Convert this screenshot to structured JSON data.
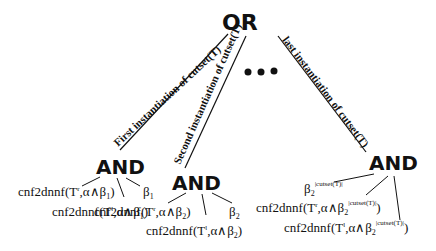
{
  "root": {
    "label": "OR"
  },
  "ellipsis": "• • •",
  "branches": [
    {
      "edge_label": "First instantiation of cutset(T)",
      "node": "AND",
      "children": [
        "cnf2dnnf(T^r,α∧β_1)",
        "β_1",
        "cnf2dnnf(T^l,α∧β_1)"
      ]
    },
    {
      "edge_label": "Second instantiation of cutset(T)",
      "node": "AND",
      "children": [
        "cnf2dnnf(T^r,α∧β_2)",
        "β_2",
        "cnf2dnnf(T^l,α∧β_2)"
      ]
    },
    {
      "edge_label": "last instantiation of cutset(T)",
      "node": "AND",
      "children": [
        "β_2^|cutset(T)|",
        "cnf2dnnf(T^r,α∧β_2^|cutset(T)|)",
        "cnf2dnnf(T^l,α∧β_2^|cutset(T)|)"
      ]
    }
  ],
  "text": {
    "or": "OR",
    "and1": "AND",
    "and2": "AND",
    "and3": "AND",
    "e1": "First instantiation of cutset(T)",
    "e2": "Second instantiation of cutset(T)",
    "e3": "last instantiation of cutset(T)",
    "cnf": "cnf2dnnf(T",
    "r": "r",
    "l": "l",
    "alpha_beta": ",α∧β",
    "one": "1",
    "two": "2",
    "beta": "β",
    "close": ")",
    "cut": "|cutset(T)|"
  }
}
